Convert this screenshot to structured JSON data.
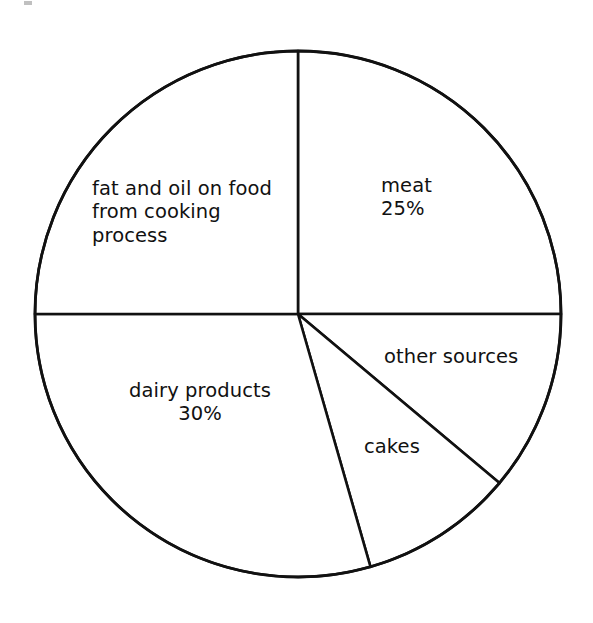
{
  "figure": {
    "background_color": "#ffffff",
    "stroke_color": "#111111",
    "text_color": "#111111"
  },
  "labels": {
    "fat_and_oil": "fat and oil on food\nfrom cooking\nprocess",
    "meat": "meat\n25%",
    "dairy_products": "dairy products\n30%",
    "other_sources": "other sources",
    "cakes": "cakes"
  },
  "chart_data": {
    "type": "pie",
    "title": "",
    "subtitle": "",
    "xlabel": "",
    "ylabel": "",
    "grid": false,
    "legend_position": "none",
    "label_style": "inside-slice",
    "units": "percent",
    "start_angle_deg": 90,
    "direction": "clockwise",
    "center_px": [
      298,
      314
    ],
    "radius_px": 263,
    "categories": [
      "meat",
      "other sources",
      "cakes",
      "dairy products",
      "fat and oil on food from cooking process"
    ],
    "values": [
      25,
      11,
      9,
      30,
      25
    ],
    "displayed_value_labels": [
      "25%",
      "",
      "",
      "30%",
      ""
    ],
    "slices": [
      {
        "name": "meat",
        "label": "meat",
        "value": 25,
        "value_label": "25%",
        "start_angle_deg": -90,
        "end_angle_deg": 0,
        "sweep_deg": 90,
        "fill": "#ffffff",
        "stroke": "#111111"
      },
      {
        "name": "other sources",
        "label": "other sources",
        "value": 11,
        "value_label": "",
        "start_angle_deg": 0,
        "end_angle_deg": 40,
        "sweep_deg": 40,
        "fill": "#ffffff",
        "stroke": "#111111"
      },
      {
        "name": "cakes",
        "label": "cakes",
        "value": 9,
        "value_label": "",
        "start_angle_deg": 40,
        "end_angle_deg": 74,
        "sweep_deg": 34,
        "fill": "#ffffff",
        "stroke": "#111111"
      },
      {
        "name": "dairy products",
        "label": "dairy products",
        "value": 30,
        "value_label": "30%",
        "start_angle_deg": 74,
        "end_angle_deg": 180,
        "sweep_deg": 106,
        "fill": "#ffffff",
        "stroke": "#111111"
      },
      {
        "name": "fat and oil on food from cooking process",
        "label": "fat and oil on food from cooking process",
        "value": 25,
        "value_label": "",
        "start_angle_deg": 180,
        "end_angle_deg": 270,
        "sweep_deg": 90,
        "fill": "#ffffff",
        "stroke": "#111111"
      }
    ]
  }
}
